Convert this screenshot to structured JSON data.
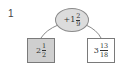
{
  "problem": {
    "number": "1"
  },
  "operator_node": {
    "sign": "+",
    "whole": "1",
    "numerator": "2",
    "denominator": "9"
  },
  "left_node": {
    "whole": "2",
    "numerator": "1",
    "denominator": "2"
  },
  "right_node": {
    "whole": "3",
    "numerator": "13",
    "denominator": "18"
  },
  "colors": {
    "left_fill": "#cfcfcf",
    "ellipse_fill": "#dcdcdc",
    "line": "#8a8a8a"
  }
}
